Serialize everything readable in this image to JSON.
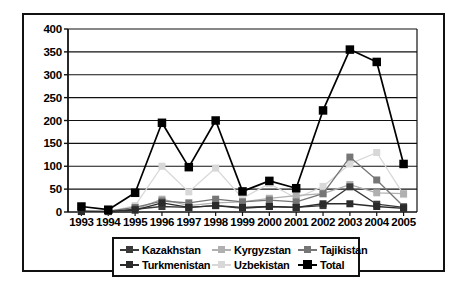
{
  "chart_data": {
    "type": "line",
    "title": "",
    "xlabel": "",
    "ylabel": "",
    "categories": [
      "1993",
      "1994",
      "1995",
      "1996",
      "1997",
      "1998",
      "1999",
      "2000",
      "2001",
      "2002",
      "2003",
      "2004",
      "2005"
    ],
    "x": [
      1993,
      1994,
      1995,
      1996,
      1997,
      1998,
      1999,
      2000,
      2001,
      2002,
      2003,
      2004,
      2005
    ],
    "ylim": [
      0,
      400
    ],
    "y_ticks": [
      0,
      50,
      100,
      150,
      200,
      250,
      300,
      350,
      400
    ],
    "grid": true,
    "legend_position": "bottom",
    "series": [
      {
        "name": "Kazakhstan",
        "color": "#3a3a3a",
        "marker": "square",
        "values": [
          2,
          1,
          6,
          12,
          10,
          14,
          8,
          12,
          10,
          14,
          55,
          17,
          10
        ]
      },
      {
        "name": "Kyrgyzstan",
        "color": "#b0b0b0",
        "marker": "square",
        "values": [
          1,
          1,
          5,
          28,
          14,
          20,
          22,
          30,
          36,
          40,
          60,
          42,
          40
        ]
      },
      {
        "name": "Tajikistan",
        "color": "#767676",
        "marker": "square",
        "values": [
          2,
          2,
          10,
          24,
          20,
          28,
          22,
          26,
          22,
          40,
          120,
          70,
          12
        ]
      },
      {
        "name": "Turkmenistan",
        "color": "#2b2b2b",
        "marker": "square",
        "values": [
          1,
          1,
          4,
          20,
          10,
          14,
          10,
          12,
          10,
          18,
          18,
          12,
          8
        ]
      },
      {
        "name": "Uzbekistan",
        "color": "#d8d8d8",
        "marker": "square",
        "values": [
          1,
          1,
          14,
          100,
          44,
          96,
          30,
          62,
          30,
          56,
          105,
          130,
          38
        ]
      },
      {
        "name": "Total",
        "color": "#000000",
        "marker": "square-large",
        "values": [
          12,
          5,
          42,
          195,
          98,
          200,
          45,
          68,
          52,
          222,
          355,
          328,
          105
        ]
      }
    ]
  },
  "legend": {
    "rows": [
      [
        {
          "label": "Kazakhstan",
          "series": "Kazakhstan"
        },
        {
          "label": "Kyrgyzstan",
          "series": "Kyrgyzstan"
        },
        {
          "label": "Tajikistan",
          "series": "Tajikistan"
        }
      ],
      [
        {
          "label": "Turkmenistan",
          "series": "Turkmenistan"
        },
        {
          "label": "Uzbekistan",
          "series": "Uzbekistan"
        },
        {
          "label": "Total",
          "series": "Total"
        }
      ]
    ]
  },
  "axis_colors": {
    "axis_line": "#111111",
    "grid_line": "#111111",
    "frame": "#111111",
    "background": "#ffffff"
  }
}
